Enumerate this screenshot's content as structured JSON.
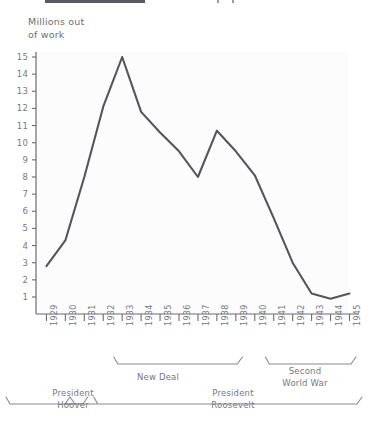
{
  "page": {
    "top_clipped_bar": "",
    "y_axis_title": "Millions out\nof work"
  },
  "chart_data": {
    "type": "line",
    "title": "",
    "xlabel": "",
    "ylabel": "Millions out of work",
    "x": [
      1929,
      1930,
      1931,
      1932,
      1933,
      1934,
      1935,
      1936,
      1937,
      1938,
      1939,
      1940,
      1941,
      1942,
      1943,
      1944,
      1945
    ],
    "categories": [
      "1929",
      "1930",
      "1931",
      "1932",
      "1933",
      "1934",
      "1935",
      "1936",
      "1937",
      "1938",
      "1939",
      "1940",
      "1941",
      "1942",
      "1943",
      "1944",
      "1945"
    ],
    "values": [
      2.8,
      4.3,
      8.0,
      12.1,
      15.0,
      11.8,
      10.6,
      9.5,
      8.0,
      10.7,
      9.5,
      8.1,
      5.6,
      3.0,
      1.2,
      0.9,
      1.2
    ],
    "ylim": [
      0,
      15
    ],
    "yticks": [
      1,
      2,
      3,
      4,
      5,
      6,
      7,
      8,
      9,
      10,
      11,
      12,
      13,
      14,
      15
    ],
    "ytick_labels": [
      "1",
      "2",
      "3",
      "4",
      "5",
      "6",
      "7",
      "8",
      "9",
      "10",
      "11",
      "12",
      "13",
      "14",
      "15"
    ],
    "grid": false,
    "legend": "none",
    "line_color": "#55555b",
    "annotations": [
      {
        "label": "New Deal",
        "start": 1933,
        "end": 1939
      },
      {
        "label": "Second\nWorld War",
        "start": 1941,
        "end": 1945
      },
      {
        "label": "President\nHoover",
        "start": 1929,
        "end": 1932
      },
      {
        "label": "President\nRoosevelt",
        "start": 1933,
        "end": 1945
      }
    ]
  },
  "brackets": {
    "new_deal": "New Deal",
    "second_world_war": "Second\nWorld War",
    "president_hoover": "President\nHoover",
    "president_roosevelt": "President\nRoosevelt"
  }
}
